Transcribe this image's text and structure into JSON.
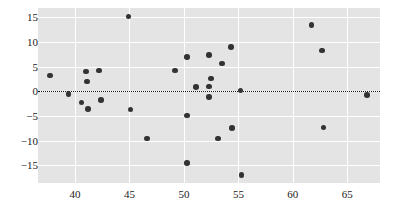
{
  "chart_data": {
    "type": "scatter",
    "title": "",
    "xlabel": "",
    "ylabel": "",
    "xlim": [
      36.6,
      68.0
    ],
    "ylim": [
      -18.6,
      16.9
    ],
    "xticks": [
      40,
      45,
      50,
      55,
      60,
      65
    ],
    "yticks": [
      15,
      10,
      5,
      0,
      -5,
      -10,
      -15
    ],
    "grid": true,
    "legend": null,
    "annotations": [
      {
        "type": "hline",
        "y": 0,
        "style": "dotted",
        "color": "#1a1a1a"
      }
    ],
    "marker": {
      "shape": "circle",
      "color": "#333333",
      "size": 5.6
    },
    "panel_background": "#e4e4e4",
    "grid_color": "#ffffff",
    "points": [
      {
        "x": 37.7,
        "y": 3.2
      },
      {
        "x": 39.4,
        "y": -0.6
      },
      {
        "x": 40.6,
        "y": -2.3
      },
      {
        "x": 41.0,
        "y": 4.0
      },
      {
        "x": 41.1,
        "y": 2.0
      },
      {
        "x": 41.2,
        "y": -3.6
      },
      {
        "x": 42.2,
        "y": 4.2
      },
      {
        "x": 42.4,
        "y": -1.8
      },
      {
        "x": 44.9,
        "y": 15.2
      },
      {
        "x": 45.1,
        "y": -3.7
      },
      {
        "x": 46.6,
        "y": -9.6
      },
      {
        "x": 49.2,
        "y": 4.2
      },
      {
        "x": 50.3,
        "y": 7.0
      },
      {
        "x": 50.3,
        "y": -4.9
      },
      {
        "x": 50.3,
        "y": -14.6
      },
      {
        "x": 51.1,
        "y": 0.9
      },
      {
        "x": 52.3,
        "y": 7.4
      },
      {
        "x": 52.3,
        "y": 1.0
      },
      {
        "x": 52.3,
        "y": -1.2
      },
      {
        "x": 52.5,
        "y": 2.6
      },
      {
        "x": 53.1,
        "y": -9.6
      },
      {
        "x": 53.5,
        "y": 5.6
      },
      {
        "x": 54.3,
        "y": 9.0
      },
      {
        "x": 54.4,
        "y": -7.4
      },
      {
        "x": 55.2,
        "y": 0.2
      },
      {
        "x": 55.3,
        "y": -17.0
      },
      {
        "x": 61.7,
        "y": 13.5
      },
      {
        "x": 62.7,
        "y": 8.3
      },
      {
        "x": 62.8,
        "y": -7.3
      },
      {
        "x": 66.8,
        "y": -0.7
      }
    ]
  }
}
